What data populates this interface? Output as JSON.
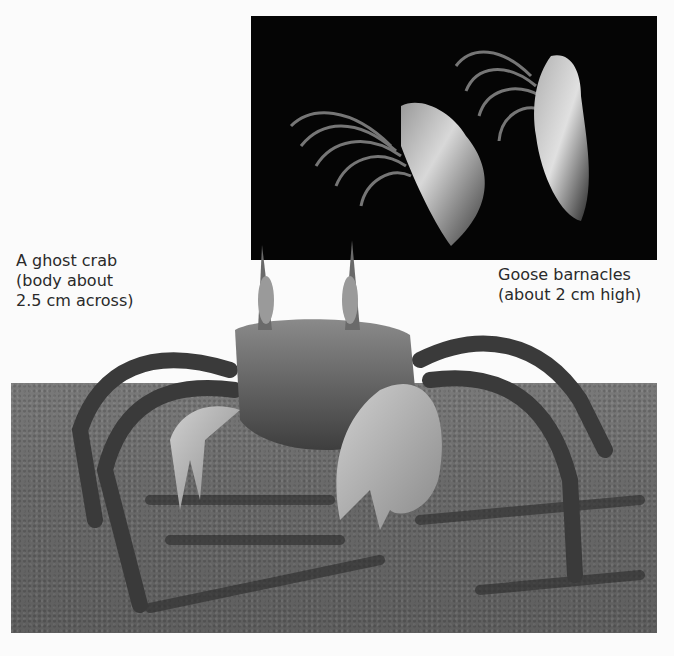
{
  "figure": {
    "photos": [
      {
        "subject": "Goose barnacles",
        "background": "black"
      },
      {
        "subject": "A ghost crab",
        "background": "sand"
      }
    ],
    "captions": {
      "crab": [
        "A ghost crab",
        "(body about",
        "2.5 cm across)"
      ],
      "barnacles": [
        "Goose barnacles",
        "(about 2 cm high)"
      ]
    }
  }
}
